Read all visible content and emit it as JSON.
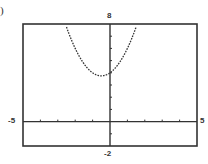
{
  "panel_label": ")",
  "chart_data": {
    "type": "line",
    "title": "",
    "xlabel": "",
    "ylabel": "",
    "xlim": [
      -5,
      5
    ],
    "ylim": [
      -2,
      8
    ],
    "x_tick_labels": [
      "-5",
      "5"
    ],
    "y_tick_labels": [
      "-2",
      "8"
    ],
    "x_tick_step": 1,
    "y_tick_step": 1,
    "grid": false,
    "legend": null,
    "series": [
      {
        "name": "parabola",
        "style": "dotted",
        "equation_estimate": "y = x^2 + x + 4",
        "vertex": [
          -0.5,
          3.75
        ],
        "x": [
          -2.5,
          -2,
          -1.5,
          -1,
          -0.5,
          0,
          0.5,
          1,
          1.5
        ],
        "y": [
          7.75,
          6,
          4.75,
          4,
          3.75,
          4,
          4.75,
          6,
          7.75
        ]
      }
    ]
  },
  "labels": {
    "ymax": "8",
    "ymin": "-2",
    "xmin": "-5",
    "xmax": "5"
  },
  "colors": {
    "frame": "#333333",
    "curve": "#333333",
    "background": "#ffffff"
  }
}
